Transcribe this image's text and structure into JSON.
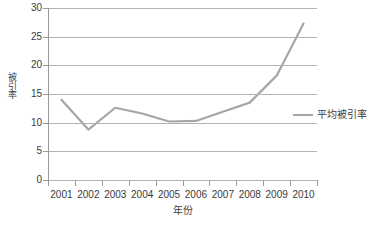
{
  "chart_data": {
    "type": "line",
    "title": "",
    "xlabel": "年份",
    "ylabel": "被引率",
    "categories": [
      "2001",
      "2002",
      "2003",
      "2004",
      "2005",
      "2006",
      "2007",
      "2008",
      "2009",
      "2010"
    ],
    "series": [
      {
        "name": "平均被引率",
        "color": "#a6a6a6",
        "values": [
          14.0,
          8.8,
          12.6,
          11.6,
          10.2,
          10.3,
          11.9,
          13.5,
          18.2,
          27.3
        ]
      }
    ],
    "ylim": [
      0,
      30
    ],
    "yticks": [
      0,
      5,
      10,
      15,
      20,
      25,
      30
    ],
    "ytick_labels": [
      "0",
      "5",
      "10",
      "15",
      "20",
      "25",
      "30"
    ],
    "grid": "horizontal",
    "grid_color": "#b3b3b3",
    "legend_position": "right",
    "legend_entries": [
      "平均被引率"
    ],
    "axis_color": "#9a9a9a",
    "background": "#ffffff"
  },
  "bottom_caption": ""
}
